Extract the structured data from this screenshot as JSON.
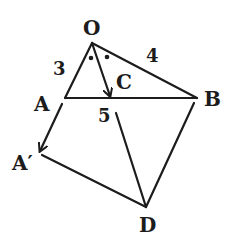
{
  "diagram": {
    "points": {
      "O": "O",
      "A": "A",
      "B": "B",
      "C": "C",
      "A_prime": "A′",
      "D": "D"
    },
    "lengths": {
      "OA": "3",
      "OB": "4",
      "AB": "5"
    },
    "segments": [
      {
        "id": "OA",
        "from": "O",
        "to": "A",
        "arrow": false
      },
      {
        "id": "OB",
        "from": "O",
        "to": "B",
        "arrow": false
      },
      {
        "id": "AB",
        "from": "A",
        "to": "B",
        "arrow": false
      },
      {
        "id": "OC",
        "from": "O",
        "to": "C",
        "arrow": true
      },
      {
        "id": "AA_prime",
        "from": "A",
        "to": "A′",
        "arrow": true
      },
      {
        "id": "A_primeD",
        "from": "A′",
        "to": "D",
        "arrow": false
      },
      {
        "id": "BD",
        "from": "B",
        "to": "D",
        "arrow": false
      },
      {
        "id": "5D",
        "from": "5",
        "to": "D",
        "arrow": false
      }
    ],
    "angle_marks": [
      "equal-angle-dot",
      "equal-angle-dot"
    ]
  }
}
